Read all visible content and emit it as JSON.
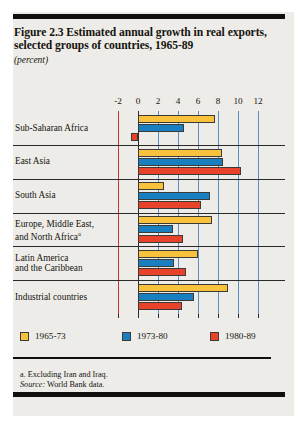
{
  "figure": {
    "title": "Figure 2.3  Estimated annual growth in real exports, selected groups of countries, 1965-89",
    "subtitle": "(percent)"
  },
  "footnotes": {
    "note_a": "a. Excluding Iran and Iraq.",
    "source_label": "Source:",
    "source_text": " World Bank data."
  },
  "legend": {
    "items": [
      {
        "label": "1965-73",
        "color": "#F9C23C",
        "swatch_name": "legend-swatch-1965-73"
      },
      {
        "label": "1973-80",
        "color": "#1A7FC1",
        "swatch_name": "legend-swatch-1973-80"
      },
      {
        "label": "1980-89",
        "color": "#E8432A",
        "swatch_name": "legend-swatch-1980-89"
      }
    ]
  },
  "chart_data": {
    "type": "bar",
    "orientation": "horizontal",
    "title": "Figure 2.3  Estimated annual growth in real exports, selected groups of countries, 1965-89",
    "subtitle": "(percent)",
    "xlabel": "",
    "ylabel": "",
    "unit": "percent",
    "xlim": [
      -2,
      12
    ],
    "xticks": [
      -2,
      0,
      2,
      4,
      6,
      8,
      10,
      12
    ],
    "xtick_labels": [
      "-2",
      "0",
      "2",
      "4",
      "6",
      "8",
      "10",
      "12"
    ],
    "grid": true,
    "grid_axis": "x",
    "legend_position": "bottom",
    "zero_line": 0,
    "categories": [
      "Sub-Saharan Africa",
      "East Asia",
      "South Asia",
      "Europe, Middle East, and North Africa",
      "Latin America and the Caribbean",
      "Industrial countries"
    ],
    "category_labels_display": [
      [
        "Sub-Saharan Africa"
      ],
      [
        "East Asia"
      ],
      [
        "South Asia"
      ],
      [
        "Europe, Middle East,",
        "and North Africa"
      ],
      [
        "Latin America",
        "and the Caribbean"
      ],
      [
        "Industrial countries"
      ]
    ],
    "category_footnote_marker": {
      "Europe, Middle East, and North Africa": "a"
    },
    "series": [
      {
        "name": "1965-73",
        "color": "#F9C23C",
        "values": [
          7.7,
          8.4,
          2.6,
          7.4,
          6.0,
          9.0
        ]
      },
      {
        "name": "1973-80",
        "color": "#1A7FC1",
        "values": [
          4.6,
          8.5,
          7.2,
          3.5,
          3.6,
          5.6
        ]
      },
      {
        "name": "1980-89",
        "color": "#E8432A",
        "values": [
          -0.7,
          10.3,
          6.3,
          4.5,
          4.8,
          4.4
        ]
      }
    ]
  }
}
